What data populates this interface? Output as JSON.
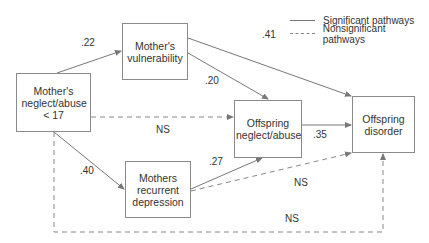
{
  "diagram": {
    "type": "path-model",
    "nodes": [
      {
        "id": "mother_neglect",
        "label": "Mother's neglect/abuse < 17",
        "lines": [
          "Mother's",
          "neglect/abuse",
          "< 17"
        ]
      },
      {
        "id": "mother_vuln",
        "label": "Mother's vulnerability",
        "lines": [
          "Mother's",
          "vulnerability"
        ]
      },
      {
        "id": "offspring_neglect",
        "label": "Offspring neglect/abuse",
        "lines": [
          "Offspring",
          "neglect/abuse"
        ]
      },
      {
        "id": "mother_depression",
        "label": "Mothers recurrent depression",
        "lines": [
          "Mothers",
          "recurrent",
          "depression"
        ]
      },
      {
        "id": "offspring_disorder",
        "label": "Offspring disorder",
        "lines": [
          "Offspring",
          "disorder"
        ]
      }
    ],
    "edges": [
      {
        "from": "mother_neglect",
        "to": "mother_vuln",
        "label": ".22",
        "significant": true
      },
      {
        "from": "mother_vuln",
        "to": "offspring_disorder",
        "label": ".41",
        "significant": true
      },
      {
        "from": "mother_vuln",
        "to": "offspring_neglect",
        "label": ".20",
        "significant": true
      },
      {
        "from": "mother_neglect",
        "to": "offspring_neglect",
        "label": "NS",
        "significant": false
      },
      {
        "from": "offspring_neglect",
        "to": "offspring_disorder",
        "label": ".35",
        "significant": true
      },
      {
        "from": "mother_neglect",
        "to": "mother_depression",
        "label": ".40",
        "significant": true
      },
      {
        "from": "mother_depression",
        "to": "offspring_neglect",
        "label": ".27",
        "significant": true
      },
      {
        "from": "mother_depression",
        "to": "offspring_disorder",
        "label": "NS",
        "significant": false
      },
      {
        "from": "mother_neglect",
        "to": "offspring_disorder",
        "label": "NS",
        "significant": false
      }
    ],
    "legend": {
      "significant": "Significant pathways",
      "nonsignificant": "Nonsignificant pathways"
    }
  }
}
